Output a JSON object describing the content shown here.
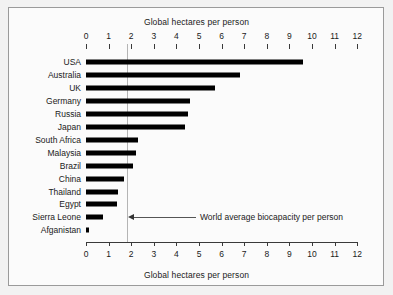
{
  "chart_data": {
    "type": "bar",
    "orientation": "horizontal",
    "title": "",
    "xlabel": "Global hectares per person",
    "ylabel": "",
    "xlim": [
      0,
      12
    ],
    "xticks": [
      0,
      1,
      2,
      3,
      4,
      5,
      6,
      7,
      8,
      9,
      10,
      11,
      12
    ],
    "xtick_labels": [
      "0",
      "1",
      "2",
      "3",
      "4",
      "5",
      "6",
      "7",
      "8",
      "9",
      "10",
      "11",
      "12"
    ],
    "grid": false,
    "legend": null,
    "top_axis_label": "Global hectares per person",
    "bottom_axis_label": "Global hectares per person",
    "categories": [
      "USA",
      "Australia",
      "UK",
      "Germany",
      "Russia",
      "Japan",
      "South Africa",
      "Malaysia",
      "Brazil",
      "China",
      "Thailand",
      "Egypt",
      "Sierra Leone",
      "Afganistan"
    ],
    "values": [
      9.6,
      6.8,
      5.7,
      4.6,
      4.5,
      4.4,
      2.3,
      2.2,
      2.1,
      1.7,
      1.4,
      1.35,
      0.75,
      0.12
    ],
    "annotations": [
      {
        "text": "World average biocapacity per person",
        "value": 1.8,
        "type": "reference-line-with-arrow"
      }
    ],
    "colors": {
      "bar": "#000000",
      "reference_line": "#b4b4b4",
      "axis": "#3a3a3a",
      "frame": "#9a9a9a",
      "background": "#fbfbfb",
      "page_background": "#f2f2f2",
      "text": "#1a1a1a"
    }
  }
}
